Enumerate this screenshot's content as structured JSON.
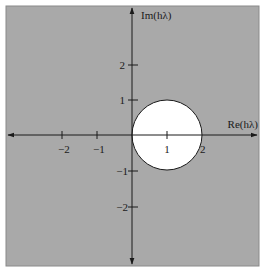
{
  "diagram": {
    "background_color": "#a9a9a9",
    "region_fill_color": "#ffffff",
    "line_color": "#1a1a1a",
    "x_axis": {
      "label": "Re(hλ)",
      "ticks": [
        {
          "value": -2,
          "label": "−2"
        },
        {
          "value": -1,
          "label": "−1"
        },
        {
          "value": 1,
          "label": "1"
        },
        {
          "value": 2,
          "label": "2"
        }
      ]
    },
    "y_axis": {
      "label": "Im(hλ)",
      "ticks": [
        {
          "value": 2,
          "label": "2"
        },
        {
          "value": 1,
          "label": "1"
        },
        {
          "value": -1,
          "label": "−1"
        },
        {
          "value": -2,
          "label": "−2"
        }
      ]
    },
    "region": {
      "shape": "disk",
      "center": [
        1,
        0
      ],
      "radius": 1,
      "description": "Stable region: |hλ − 1| ≤ 1 (white disk)"
    }
  }
}
